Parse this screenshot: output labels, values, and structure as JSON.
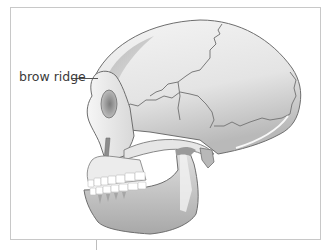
{
  "figure": {
    "labels": [
      {
        "text": "brow ridge",
        "target": "brow-ridge"
      }
    ]
  },
  "colors": {
    "frame": "#c8c8c8",
    "bone_light": "#f2f2f2",
    "bone_mid": "#d6d6d6",
    "bone_shadow": "#9a9a9a",
    "suture": "#7a7a7a",
    "outline": "#6e6e6e",
    "teeth": "#ffffff",
    "label_text": "#3a3a3a"
  }
}
